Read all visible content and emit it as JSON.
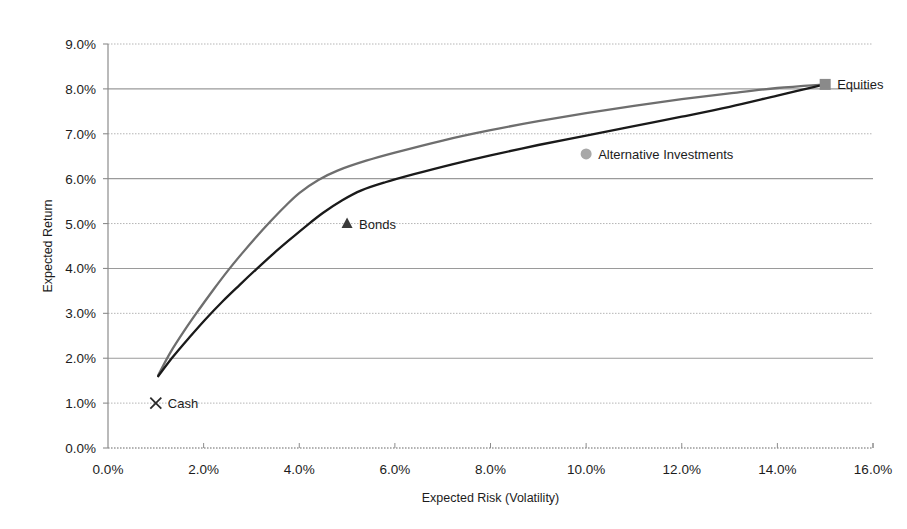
{
  "chart_data": {
    "type": "line",
    "title": "",
    "xlabel": "Expected Risk (Volatility)",
    "ylabel": "Expected Return",
    "xlim": [
      0,
      16
    ],
    "ylim": [
      0,
      9
    ],
    "grid": true,
    "legend_position": "none",
    "x_tick_labels": [
      "0.0%",
      "2.0%",
      "4.0%",
      "6.0%",
      "8.0%",
      "10.0%",
      "12.0%",
      "14.0%",
      "16.0%"
    ],
    "x_tick_values": [
      0,
      2,
      4,
      6,
      8,
      10,
      12,
      14,
      16
    ],
    "y_tick_labels": [
      "0.0%",
      "1.0%",
      "2.0%",
      "3.0%",
      "4.0%",
      "5.0%",
      "6.0%",
      "7.0%",
      "8.0%",
      "9.0%"
    ],
    "y_tick_values": [
      0,
      1,
      2,
      3,
      4,
      5,
      6,
      7,
      8,
      9
    ],
    "series": [
      {
        "name": "upper-frontier",
        "color": "#6e6e6e",
        "points": [
          [
            1.05,
            1.62
          ],
          [
            1.3,
            2.12
          ],
          [
            1.6,
            2.62
          ],
          [
            1.9,
            3.08
          ],
          [
            2.2,
            3.52
          ],
          [
            2.5,
            3.94
          ],
          [
            2.8,
            4.33
          ],
          [
            3.1,
            4.7
          ],
          [
            3.4,
            5.05
          ],
          [
            3.7,
            5.38
          ],
          [
            4.0,
            5.68
          ],
          [
            4.4,
            5.97
          ],
          [
            4.8,
            6.18
          ],
          [
            5.4,
            6.4
          ],
          [
            6.0,
            6.58
          ],
          [
            7.0,
            6.85
          ],
          [
            8.0,
            7.08
          ],
          [
            9.0,
            7.28
          ],
          [
            10.0,
            7.46
          ],
          [
            11.0,
            7.62
          ],
          [
            12.0,
            7.77
          ],
          [
            13.0,
            7.9
          ],
          [
            14.0,
            8.02
          ],
          [
            15.0,
            8.1
          ]
        ]
      },
      {
        "name": "lower-frontier",
        "color": "#1a1a1a",
        "points": [
          [
            1.05,
            1.6
          ],
          [
            1.35,
            2.02
          ],
          [
            1.7,
            2.46
          ],
          [
            2.05,
            2.88
          ],
          [
            2.4,
            3.27
          ],
          [
            2.75,
            3.63
          ],
          [
            3.1,
            3.98
          ],
          [
            3.45,
            4.32
          ],
          [
            3.8,
            4.64
          ],
          [
            4.15,
            4.95
          ],
          [
            4.5,
            5.24
          ],
          [
            4.9,
            5.52
          ],
          [
            5.3,
            5.74
          ],
          [
            5.8,
            5.92
          ],
          [
            6.4,
            6.1
          ],
          [
            7.2,
            6.32
          ],
          [
            8.0,
            6.52
          ],
          [
            9.0,
            6.75
          ],
          [
            10.0,
            6.96
          ],
          [
            11.0,
            7.17
          ],
          [
            12.0,
            7.38
          ],
          [
            13.0,
            7.6
          ],
          [
            14.0,
            7.85
          ],
          [
            15.0,
            8.1
          ]
        ]
      }
    ],
    "annotations": [
      {
        "label": "Cash",
        "x": 1.0,
        "y": 1.0,
        "marker": "x-marker",
        "color": "#2a2a2a"
      },
      {
        "label": "Bonds",
        "x": 5.0,
        "y": 5.0,
        "marker": "triangle-marker",
        "color": "#3a3a3a"
      },
      {
        "label": "Alternative Investments",
        "x": 10.0,
        "y": 6.55,
        "marker": "circle-marker",
        "color": "#a8a8a8"
      },
      {
        "label": "Equities",
        "x": 15.0,
        "y": 8.1,
        "marker": "square-marker",
        "color": "#8a8a8a"
      }
    ]
  },
  "axes": {
    "x_title": "Expected Risk (Volatility)",
    "y_title": "Expected Return"
  },
  "colors": {
    "upper_curve": "#6e6e6e",
    "lower_curve": "#1a1a1a",
    "gridline_solid": "#9a9a9a",
    "gridline_dotted": "#b5b5b5",
    "axis": "#8c8c8c",
    "background": "#ffffff"
  }
}
